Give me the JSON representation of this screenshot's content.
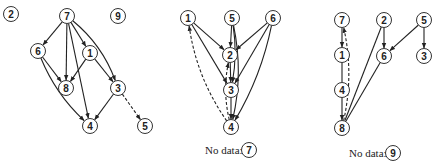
{
  "diagram": {
    "colors": {
      "stroke": "#222222",
      "node_fill": "#ffffff"
    },
    "graphs": [
      {
        "id": "graph-1",
        "nodes": [
          {
            "id": "2",
            "label": "2",
            "x": 11,
            "y": 14
          },
          {
            "id": "7",
            "label": "7",
            "x": 67,
            "y": 16
          },
          {
            "id": "9",
            "label": "9",
            "x": 118,
            "y": 16
          },
          {
            "id": "6",
            "label": "6",
            "x": 38,
            "y": 51
          },
          {
            "id": "1",
            "label": "1",
            "x": 90,
            "y": 53
          },
          {
            "id": "8",
            "label": "8",
            "x": 66,
            "y": 88
          },
          {
            "id": "3",
            "label": "3",
            "x": 118,
            "y": 88
          },
          {
            "id": "4",
            "label": "4",
            "x": 90,
            "y": 126
          },
          {
            "id": "5",
            "label": "5",
            "x": 145,
            "y": 126
          }
        ],
        "edges": [
          {
            "from": "7",
            "to": "6",
            "style": "solid",
            "curve": 0
          },
          {
            "from": "7",
            "to": "8",
            "style": "solid",
            "curve": 0
          },
          {
            "from": "7",
            "to": "1",
            "style": "solid",
            "curve": 0
          },
          {
            "from": "7",
            "to": "4",
            "style": "solid",
            "curve": 0
          },
          {
            "from": "7",
            "to": "3",
            "style": "solid",
            "curve": -12
          },
          {
            "from": "6",
            "to": "8",
            "style": "solid",
            "curve": 0
          },
          {
            "from": "6",
            "to": "4",
            "style": "solid",
            "curve": 10
          },
          {
            "from": "1",
            "to": "8",
            "style": "solid",
            "curve": 0
          },
          {
            "from": "1",
            "to": "3",
            "style": "solid",
            "curve": 0
          },
          {
            "from": "3",
            "to": "4",
            "style": "solid",
            "curve": 0
          },
          {
            "from": "3",
            "to": "5",
            "style": "dashed",
            "curve": 0
          }
        ],
        "caption": null
      },
      {
        "id": "graph-2",
        "nodes": [
          {
            "id": "1",
            "label": "1",
            "x": 188,
            "y": 18
          },
          {
            "id": "5",
            "label": "5",
            "x": 232,
            "y": 18
          },
          {
            "id": "6",
            "label": "6",
            "x": 273,
            "y": 18
          },
          {
            "id": "2",
            "label": "2",
            "x": 230,
            "y": 55
          },
          {
            "id": "3",
            "label": "3",
            "x": 231,
            "y": 90
          },
          {
            "id": "4",
            "label": "4",
            "x": 231,
            "y": 127
          }
        ],
        "edges": [
          {
            "from": "1",
            "to": "2",
            "style": "solid",
            "curve": 0
          },
          {
            "from": "1",
            "to": "3",
            "style": "solid",
            "curve": 0
          },
          {
            "from": "5",
            "to": "2",
            "style": "solid",
            "curve": 0
          },
          {
            "from": "5",
            "to": "3",
            "style": "solid",
            "curve": -6
          },
          {
            "from": "5",
            "to": "4",
            "style": "solid",
            "curve": -12
          },
          {
            "from": "6",
            "to": "2",
            "style": "solid",
            "curve": 0
          },
          {
            "from": "6",
            "to": "3",
            "style": "solid",
            "curve": 0
          },
          {
            "from": "6",
            "to": "4",
            "style": "solid",
            "curve": -10
          },
          {
            "from": "2",
            "to": "3",
            "style": "solid",
            "curve": 0
          },
          {
            "from": "3",
            "to": "4",
            "style": "solid",
            "curve": 0
          },
          {
            "from": "4",
            "to": "1",
            "style": "dashed",
            "curve": -14
          },
          {
            "from": "4",
            "to": "2",
            "style": "dashed",
            "curve": -8
          }
        ],
        "caption": {
          "text": "No data:",
          "node": "7",
          "x": 205,
          "y": 150,
          "node_x": 249
        }
      },
      {
        "id": "graph-3",
        "nodes": [
          {
            "id": "7",
            "label": "7",
            "x": 342,
            "y": 20
          },
          {
            "id": "2",
            "label": "2",
            "x": 384,
            "y": 20
          },
          {
            "id": "5",
            "label": "5",
            "x": 424,
            "y": 20
          },
          {
            "id": "1",
            "label": "1",
            "x": 342,
            "y": 55
          },
          {
            "id": "6",
            "label": "6",
            "x": 384,
            "y": 56
          },
          {
            "id": "3",
            "label": "3",
            "x": 424,
            "y": 56
          },
          {
            "id": "4",
            "label": "4",
            "x": 342,
            "y": 90
          },
          {
            "id": "8",
            "label": "8",
            "x": 342,
            "y": 128
          }
        ],
        "edges": [
          {
            "from": "7",
            "to": "1",
            "style": "solid",
            "curve": 0
          },
          {
            "from": "1",
            "to": "4",
            "style": "solid",
            "curve": 0,
            "arrow": false
          },
          {
            "from": "4",
            "to": "8",
            "style": "solid",
            "curve": 0
          },
          {
            "from": "2",
            "to": "6",
            "style": "solid",
            "curve": 0
          },
          {
            "from": "2",
            "to": "8",
            "style": "solid",
            "curve": 0,
            "arrow": false
          },
          {
            "from": "5",
            "to": "6",
            "style": "solid",
            "curve": 0
          },
          {
            "from": "5",
            "to": "3",
            "style": "solid",
            "curve": 0
          },
          {
            "from": "6",
            "to": "8",
            "style": "solid",
            "curve": 0,
            "arrow": false
          },
          {
            "from": "8",
            "to": "7",
            "style": "dashed",
            "curve": 12
          }
        ],
        "caption": {
          "text": "No data:",
          "node": "9",
          "x": 349,
          "y": 153,
          "node_x": 393
        }
      }
    ]
  }
}
